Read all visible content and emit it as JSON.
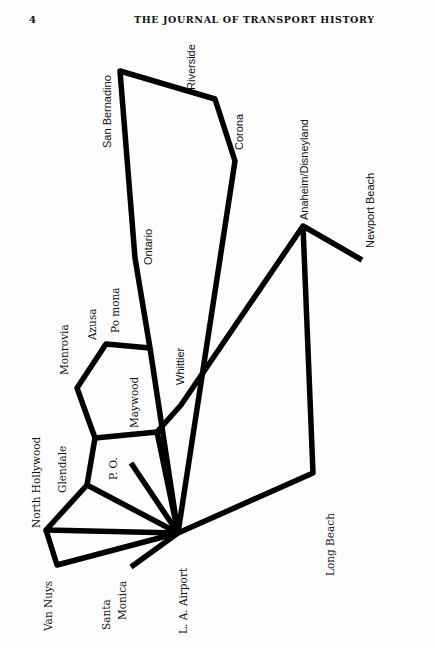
{
  "page": {
    "number": "4",
    "running_head": "THE JOURNAL OF TRANSPORT HISTORY"
  },
  "diagram": {
    "type": "route-network-map",
    "orientation": "rotated 90deg counter-clockwise",
    "line_color": "#000000",
    "hub": "L. A. Airport",
    "nodes": [
      {
        "id": "lax",
        "label": "L. A. Airport",
        "x": 178,
        "y": 533
      },
      {
        "id": "san_bernardino",
        "label": "San Bernadino",
        "x": 120,
        "y": 71
      },
      {
        "id": "riverside",
        "label": "Riverside",
        "x": 195,
        "y": 100
      },
      {
        "id": "corona",
        "label": "Corona",
        "x": 235,
        "y": 161
      },
      {
        "id": "ontario",
        "label": "Ontario",
        "x": 135,
        "y": 260
      },
      {
        "id": "pomona",
        "label": "Po mona",
        "x": 140,
        "y": 331
      },
      {
        "id": "azusa",
        "label": "Azusa",
        "x": 106,
        "y": 344
      },
      {
        "id": "monrovia",
        "label": "Monrovia",
        "x": 77,
        "y": 388
      },
      {
        "id": "maywood",
        "label": "Maywood",
        "x": 157,
        "y": 432
      },
      {
        "id": "whittier",
        "label": "Whittier",
        "x": 182,
        "y": 405
      },
      {
        "id": "glendale",
        "label": "Glendale",
        "x": 95,
        "y": 438
      },
      {
        "id": "glendale2",
        "label": "",
        "x": 87,
        "y": 485
      },
      {
        "id": "po",
        "label": "P. O.",
        "x": 131,
        "y": 463
      },
      {
        "id": "north_hollywood",
        "label": "North Hollywood",
        "x": 46,
        "y": 530
      },
      {
        "id": "van_nuys",
        "label": "Van Nuys",
        "x": 57,
        "y": 565
      },
      {
        "id": "santa_monica",
        "label": "Santa Monica",
        "x": 131,
        "y": 567
      },
      {
        "id": "anaheim",
        "label": "Anaheim/Disneyland",
        "x": 303,
        "y": 226
      },
      {
        "id": "newport_beach",
        "label": "Newport Beach",
        "x": 362,
        "y": 260
      },
      {
        "id": "long_beach",
        "label": "Long Beach",
        "x": 313,
        "y": 473
      }
    ],
    "routes": [
      {
        "from": "lax",
        "path": [
          "lax",
          "san_bernardino",
          "riverside",
          "corona",
          "lax"
        ]
      },
      {
        "from": "lax",
        "path": [
          "lax",
          "pomona",
          "azusa",
          "monrovia",
          "glendale",
          "maywood"
        ]
      },
      {
        "from": "lax",
        "path": [
          "lax",
          "maywood",
          "whittier",
          "anaheim",
          "newport_beach"
        ]
      },
      {
        "from": "lax",
        "path": [
          "anaheim",
          "long_beach",
          "lax"
        ]
      },
      {
        "from": "lax",
        "path": [
          "lax",
          "po"
        ]
      },
      {
        "from": "lax",
        "path": [
          "lax",
          "glendale2",
          "glendale"
        ]
      },
      {
        "from": "lax",
        "path": [
          "lax",
          "north_hollywood",
          "glendale2"
        ]
      },
      {
        "from": "lax",
        "path": [
          "north_hollywood",
          "van_nuys",
          "lax"
        ]
      },
      {
        "from": "lax",
        "path": [
          "lax",
          "santa_monica"
        ]
      }
    ],
    "labels": {
      "san_bernardino": "San Bernadino",
      "riverside": "Riverside",
      "corona": "Corona",
      "ontario": "Ontario",
      "anaheim": "Anaheim/Disneyland",
      "newport_beach": "Newport Beach",
      "azusa": "Azusa",
      "pomona": "Po mona",
      "monrovia": "Monrovia",
      "whittier": "Whittier",
      "maywood": "Maywood",
      "north_hollywood": "North Hollywood",
      "glendale": "Glendale",
      "po": "P. O.",
      "long_beach": "Long Beach",
      "van_nuys": "Van Nuys",
      "santa_monica_1": "Santa",
      "santa_monica_2": "Monica",
      "lax": "L. A. Airport"
    }
  }
}
